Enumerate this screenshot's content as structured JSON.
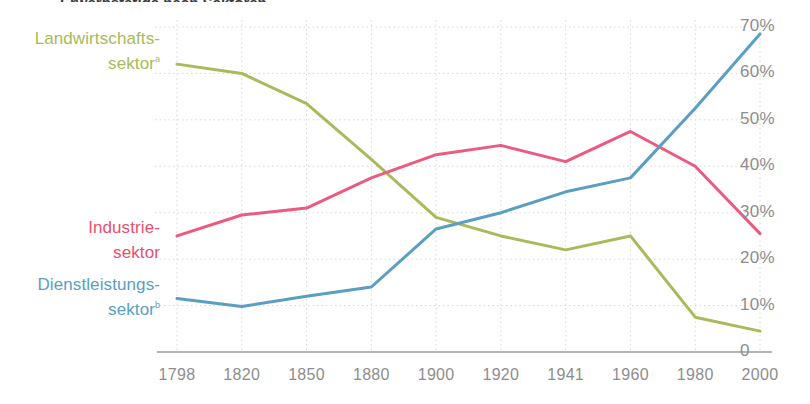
{
  "title_clipped": "Erwerbstätige nach Sektoren",
  "chart_data": {
    "type": "line",
    "title": "",
    "xlabel": "",
    "ylabel": "",
    "x": [
      1798,
      1820,
      1850,
      1880,
      1900,
      1920,
      1941,
      1960,
      1980,
      2000
    ],
    "xticklabels": [
      "1798",
      "1820",
      "1850",
      "1880",
      "1900",
      "1920",
      "1941",
      "1960",
      "1980",
      "2000"
    ],
    "yticklabels": [
      "0",
      "10%",
      "20%",
      "30%",
      "40%",
      "50%",
      "60%",
      "70%"
    ],
    "yticks": [
      0,
      10,
      20,
      30,
      40,
      50,
      60,
      70
    ],
    "ylim": [
      0,
      70
    ],
    "grid": true,
    "legend_position": "left-inline",
    "series": [
      {
        "name": "Landwirtschaftssektor",
        "name_suffix": "a",
        "color": "#a8ba5a",
        "values": [
          62.0,
          60.0,
          53.5,
          41.5,
          29.0,
          25.0,
          22.0,
          25.0,
          7.5,
          4.5
        ]
      },
      {
        "name": "Industriesektor",
        "name_suffix": "",
        "color": "#ec5b7f",
        "values": [
          25.0,
          29.5,
          31.0,
          37.5,
          42.5,
          44.5,
          41.0,
          47.5,
          40.0,
          25.5
        ]
      },
      {
        "name": "Dienstleistungssektor",
        "name_suffix": "b",
        "color": "#5a9ec4",
        "values": [
          11.5,
          9.8,
          12.0,
          14.0,
          26.5,
          30.0,
          34.5,
          37.5,
          52.5,
          68.5
        ]
      }
    ]
  },
  "legend": {
    "agriculture": {
      "line1": "Landwirtschafts-",
      "line2": "sektor",
      "marker": "a"
    },
    "industry": {
      "line1": "Industrie-",
      "line2": "sektor",
      "marker": ""
    },
    "services": {
      "line1": "Dienstleistungs-",
      "line2": "sektor",
      "marker": "b"
    }
  },
  "colors": {
    "agriculture": "#a8ba5a",
    "industry": "#ec5b7f",
    "services": "#5a9ec4",
    "grid": "#d8d8d8",
    "axis": "#9b9b9b",
    "tick_text": "#8d8d8d",
    "background": "#ffffff"
  }
}
